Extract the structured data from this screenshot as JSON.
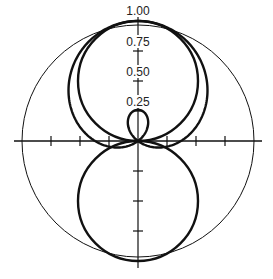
{
  "diagram": {
    "title": "",
    "type": "polar-pattern",
    "center": [
      138,
      141
    ],
    "radius": 119,
    "radial_labels": [
      "1.00",
      "0.75",
      "0.50",
      "0.25"
    ],
    "radial_values": [
      1.0,
      0.75,
      0.5,
      0.25
    ],
    "curves": [
      {
        "name": "omnidirectional",
        "formula": "r = 1",
        "stroke_width": 1
      },
      {
        "name": "figure-8-front",
        "formula": "r = cos(theta), front lobe",
        "stroke_width": 2.4
      },
      {
        "name": "figure-8-rear",
        "formula": "r = cos(theta), rear lobe",
        "stroke_width": 2.4
      },
      {
        "name": "supercardioid",
        "formula": "r = 0.37 + 0.63 cos(theta)",
        "stroke_width": 2.4
      }
    ],
    "colors": {
      "line": "#111111",
      "background": "#ffffff"
    }
  }
}
